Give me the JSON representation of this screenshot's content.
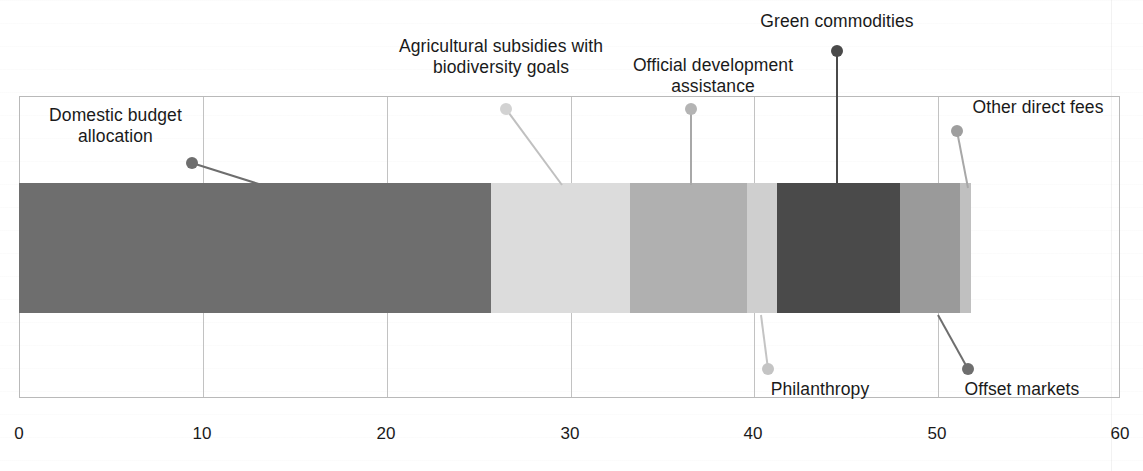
{
  "chart_data": {
    "type": "bar",
    "orientation": "horizontal",
    "stacked": true,
    "title": "",
    "subtitle": "",
    "xlabel": "",
    "ylabel": "",
    "xlim": [
      0,
      60
    ],
    "ylim": null,
    "grid": true,
    "legend_position": "callout-labels",
    "x_ticks": [
      0,
      10,
      20,
      30,
      40,
      50,
      60
    ],
    "x_tick_labels": [
      "0",
      "10",
      "20",
      "30",
      "40",
      "50",
      "60"
    ],
    "categories": [
      ""
    ],
    "series": [
      {
        "name": "Domestic budget allocation",
        "value": 25.7,
        "start": 0.0,
        "end": 25.7,
        "color": "#6e6e6e"
      },
      {
        "name": "Agricultural subsidies with biodiversity goals",
        "value": 7.6,
        "start": 25.7,
        "end": 33.3,
        "color": "#dcdcdc"
      },
      {
        "name": "Official development assistance",
        "value": 6.4,
        "start": 33.3,
        "end": 39.7,
        "color": "#b0b0b0"
      },
      {
        "name": "Philanthropy",
        "value": 1.6,
        "start": 39.7,
        "end": 41.3,
        "color": "#cfcfcf"
      },
      {
        "name": "Green commodities",
        "value": 6.7,
        "start": 41.3,
        "end": 48.0,
        "color": "#4a4a4a"
      },
      {
        "name": "Offset markets",
        "value": 3.3,
        "start": 48.0,
        "end": 51.3,
        "color": "#9a9a9a"
      },
      {
        "name": "Other direct fees",
        "value": 0.6,
        "start": 51.3,
        "end": 51.9,
        "color": "#c0c0c0"
      }
    ],
    "total": 51.9
  },
  "callouts": [
    {
      "key": "domestic-budget-allocation",
      "label": "Domestic budget\nallocation",
      "label_left": 28,
      "label_top": 105,
      "label_width": 175,
      "dot_x": 192,
      "dot_y": 163,
      "dot_color": "#6e6e6e",
      "line_color": "#6e6e6e",
      "line_to_x": 262,
      "line_to_y": 185
    },
    {
      "key": "agricultural-subsidies",
      "label": "Agricultural subsidies with\nbiodiversity goals",
      "label_left": 348,
      "label_top": 36,
      "label_width": 306,
      "dot_x": 506,
      "dot_y": 109,
      "dot_color": "#d2d2d2",
      "line_color": "#c0c0c0",
      "line_to_x": 562,
      "line_to_y": 185
    },
    {
      "key": "official-development-assistance",
      "label": "Official development\nassistance",
      "label_left": 608,
      "label_top": 55,
      "label_width": 210,
      "dot_x": 691,
      "dot_y": 109,
      "dot_color": "#b4b4b4",
      "line_color": "#a8a8a8",
      "line_to_x": 691,
      "line_to_y": 185
    },
    {
      "key": "green-commodities",
      "label": "Green commodities",
      "label_left": 734,
      "label_top": 11,
      "label_width": 206,
      "dot_x": 837,
      "dot_y": 51,
      "dot_color": "#4a4a4a",
      "line_color": "#4a4a4a",
      "line_to_x": 837,
      "line_to_y": 185
    },
    {
      "key": "other-direct-fees",
      "label": "Other direct fees",
      "label_left": 955,
      "label_top": 97,
      "label_width": 166,
      "dot_x": 957,
      "dot_y": 131,
      "dot_color": "#9e9e9e",
      "line_color": "#a8a8a8",
      "line_to_x": 968,
      "line_to_y": 188
    },
    {
      "key": "philanthropy",
      "label": "Philanthropy",
      "label_left": 757,
      "label_top": 379,
      "label_width": 126,
      "dot_x": 768,
      "dot_y": 369,
      "dot_color": "#c4c4c4",
      "line_color": "#c4c4c4",
      "line_to_x": 761,
      "line_to_y": 315
    },
    {
      "key": "offset-markets",
      "label": "Offset markets",
      "label_left": 947,
      "label_top": 379,
      "label_width": 150,
      "dot_x": 968,
      "dot_y": 369,
      "dot_color": "#6e6e6e",
      "line_color": "#6e6e6e",
      "line_to_x": 938,
      "line_to_y": 315
    }
  ],
  "axis": {
    "x_min": 0,
    "x_max": 60,
    "ticks": [
      {
        "value": "0",
        "px": 19
      },
      {
        "value": "10",
        "px": 202
      },
      {
        "value": "20",
        "px": 386
      },
      {
        "value": "30",
        "px": 570
      },
      {
        "value": "40",
        "px": 753
      },
      {
        "value": "50",
        "px": 937
      },
      {
        "value": "60",
        "px": 1120
      }
    ]
  }
}
